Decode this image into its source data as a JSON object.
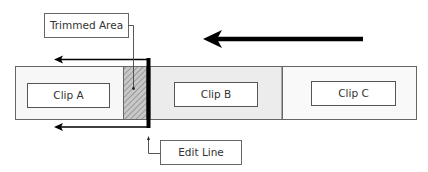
{
  "labels": {
    "trimmed_area": "Trimmed Area",
    "edit_line": "Edit Line"
  },
  "clips": [
    {
      "name": "Clip A",
      "fill": "#f7f7f7"
    },
    {
      "name": "Clip B",
      "fill": "#ececec"
    },
    {
      "name": "Clip C",
      "fill": "#f9f9f9"
    }
  ],
  "colors": {
    "stroke": "#555555",
    "hatch": "#999999",
    "edit_line": "#000000",
    "arrow": "#000000"
  }
}
